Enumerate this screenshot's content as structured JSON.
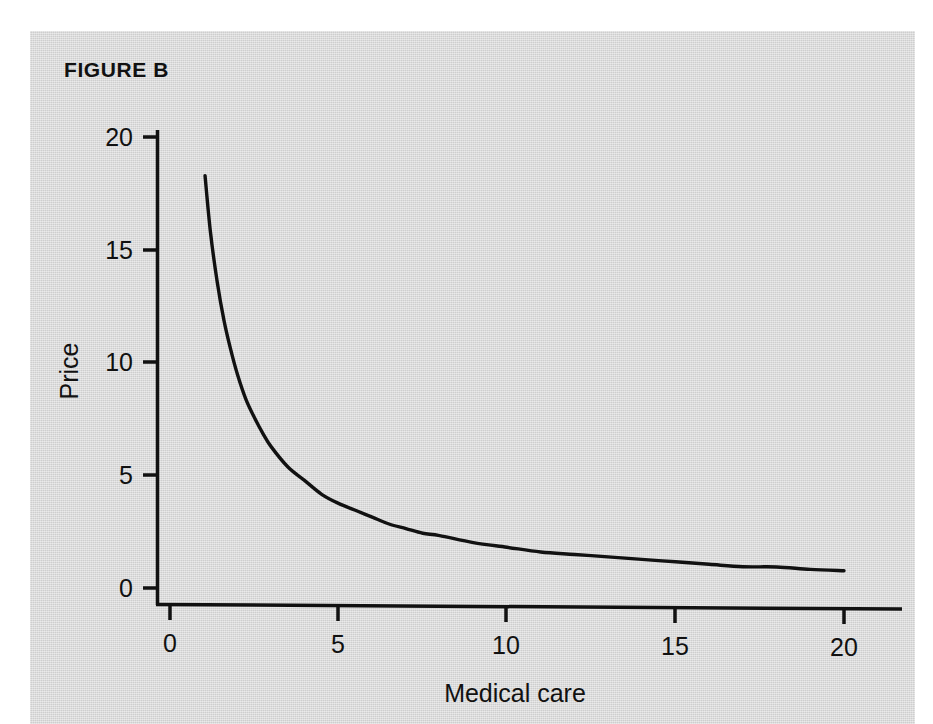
{
  "figure": {
    "title": "FIGURE B",
    "background_color": "#d2d2d2",
    "page_color": "#ffffff",
    "ink_color": "#111111"
  },
  "chart_data": {
    "type": "line",
    "title": "FIGURE B",
    "subtitle": "",
    "xlabel": "Medical care",
    "ylabel": "Price",
    "xlim": [
      0,
      21
    ],
    "ylim": [
      0,
      21
    ],
    "xticks": [
      0,
      5,
      10,
      15,
      20
    ],
    "xtick_labels": [
      "0",
      "5",
      "10",
      "15",
      "20"
    ],
    "yticks": [
      0,
      5,
      10,
      15,
      20
    ],
    "ytick_labels": [
      "0",
      "5",
      "10",
      "15",
      "20"
    ],
    "grid": false,
    "legend": null,
    "annotations": [],
    "series": [
      {
        "name": "Demand curve for medical care",
        "relation": "price = 19 / medical_care",
        "line_color": "#111111",
        "line_width": 3,
        "x": [
          1.04,
          1.2,
          1.4,
          1.6,
          1.8,
          2.0,
          2.25,
          2.5,
          2.75,
          3.0,
          3.5,
          4.0,
          4.5,
          5.0,
          5.5,
          6.0,
          6.5,
          7.0,
          7.5,
          8.0,
          9.0,
          10.0,
          11.0,
          12.0,
          13.0,
          14.0,
          15.0,
          16.0,
          17.0,
          18.0,
          19.0,
          20.0
        ],
        "y": [
          18.3,
          15.8,
          13.6,
          11.9,
          10.6,
          9.5,
          8.4,
          7.6,
          6.9,
          6.3,
          5.4,
          4.8,
          4.2,
          3.8,
          3.5,
          3.2,
          2.9,
          2.7,
          2.5,
          2.4,
          2.1,
          1.9,
          1.7,
          1.6,
          1.5,
          1.4,
          1.3,
          1.2,
          1.1,
          1.1,
          1.0,
          0.95
        ]
      }
    ]
  },
  "axes": {
    "x_axis_label": "Medical care",
    "y_axis_label": "Price",
    "x_tick_labels": [
      "0",
      "5",
      "10",
      "15",
      "20"
    ],
    "y_tick_labels": [
      "0",
      "5",
      "10",
      "15",
      "20"
    ]
  }
}
